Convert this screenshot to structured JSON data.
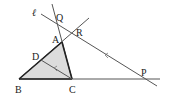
{
  "figure": {
    "points": {
      "B": {
        "label": "B",
        "x": 19,
        "y": 79
      },
      "C": {
        "label": "C",
        "x": 72,
        "y": 79
      },
      "A": {
        "label": "A",
        "x": 62,
        "y": 42
      },
      "D": {
        "label": "D",
        "x": 41,
        "y": 60
      },
      "Q": {
        "label": "Q",
        "x": 57,
        "y": 24
      },
      "R": {
        "label": "R",
        "x": 70,
        "y": 32
      },
      "P": {
        "label": "P",
        "x": 146,
        "y": 79
      }
    },
    "line_label": "ℓ",
    "colors": {
      "stroke": "#333333",
      "fill": "#dcdcdc",
      "text": "#222222"
    }
  }
}
